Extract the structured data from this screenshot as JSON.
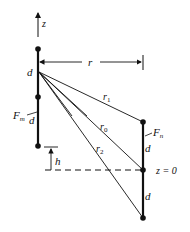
{
  "diagram": {
    "colors": {
      "ink": "#111111",
      "background": "#ffffff"
    },
    "axis_label": "z",
    "separation_label": "r",
    "left_antenna": {
      "label": "F",
      "label_sub": "m",
      "segment_label": "d",
      "segment_label_2": "d",
      "offset_label": "h"
    },
    "right_antenna": {
      "label": "F",
      "label_sub": "n",
      "segment_label": "d",
      "segment_label_2": "d",
      "ground_label": "z = 0"
    },
    "distances": [
      {
        "name": "r",
        "sub": "1"
      },
      {
        "name": "r",
        "sub": "0"
      },
      {
        "name": "r",
        "sub": "2"
      }
    ]
  }
}
